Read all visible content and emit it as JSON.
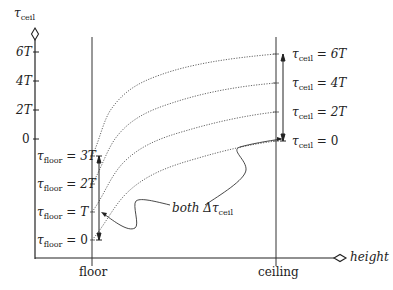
{
  "y_axis": {
    "symbol": "τ",
    "subscript": "ceil",
    "ticks": [
      {
        "label": "6T",
        "y": 52
      },
      {
        "label": "4T",
        "y": 81
      },
      {
        "label": "2T",
        "y": 110
      },
      {
        "label": "0",
        "y": 139
      }
    ]
  },
  "x_axis": {
    "label": "height",
    "ticks": [
      {
        "label": "floor",
        "x": 92
      },
      {
        "label": "ceiling",
        "x": 276
      }
    ]
  },
  "floor_labels": [
    {
      "symbol": "τ",
      "subscript": "floor",
      "rhs": "= 3T",
      "y": 156
    },
    {
      "symbol": "τ",
      "subscript": "floor",
      "rhs": "= 2T",
      "y": 184
    },
    {
      "symbol": "τ",
      "subscript": "floor",
      "rhs": "= T",
      "y": 212
    },
    {
      "symbol": "τ",
      "subscript": "floor",
      "rhs": "= 0",
      "y": 240
    }
  ],
  "ceil_labels": [
    {
      "symbol": "τ",
      "subscript": "ceil",
      "rhs": "= 6T",
      "y": 54
    },
    {
      "symbol": "τ",
      "subscript": "ceil",
      "rhs": "= 4T",
      "y": 83
    },
    {
      "symbol": "τ",
      "subscript": "ceil",
      "rhs": "= 2T",
      "y": 112
    },
    {
      "symbol": "τ",
      "subscript": "ceil",
      "rhs": "= 0",
      "y": 141
    }
  ],
  "annotation": {
    "prefix": "both",
    "delta": "Δτ",
    "subscript": "ceil"
  },
  "colors": {
    "line": "#222222",
    "curve": "#555555"
  }
}
